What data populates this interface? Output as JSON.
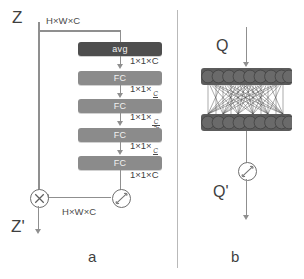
{
  "figure": {
    "caption_a": "a",
    "caption_b": "b"
  },
  "panel_a": {
    "input_label": "Z",
    "output_label": "Z'",
    "top_dim": "H×W×C",
    "bottom_dim": "H×W×C",
    "blocks": [
      {
        "label": "avg",
        "type": "pool"
      },
      {
        "label": "FC",
        "type": "fc"
      },
      {
        "label": "FC",
        "type": "fc"
      },
      {
        "label": "FC",
        "type": "fc"
      },
      {
        "label": "FC",
        "type": "fc"
      }
    ],
    "edge_dims": [
      {
        "prefix": "1×1×",
        "value": "C",
        "num": "",
        "den": ""
      },
      {
        "prefix": "1×1×",
        "value": "",
        "num": "C",
        "den": "r"
      },
      {
        "prefix": "1×1×",
        "value": "",
        "num": "C",
        "den": "2r"
      },
      {
        "prefix": "1×1×",
        "value": "",
        "num": "C",
        "den": "r"
      },
      {
        "prefix": "1×1×",
        "value": "C",
        "num": "",
        "den": ""
      }
    ],
    "sigmoid_op": "sigmoid",
    "multiply_op": "multiply"
  },
  "panel_b": {
    "input_label": "Q",
    "output_label": "Q'",
    "layers": [
      {
        "name": "top-node-row",
        "nodes": 9
      },
      {
        "name": "bottom-node-row",
        "nodes": 9
      }
    ],
    "sigmoid_op": "sigmoid"
  },
  "colors": {
    "pool_block": "#4e4e4e",
    "fc_block": "#8b8b8b",
    "node_bar": "#5c5c5c",
    "arrow": "#8f8f8f",
    "text": "#3f3f3f",
    "divider": "#b9b9b9",
    "background": "#ffffff"
  }
}
